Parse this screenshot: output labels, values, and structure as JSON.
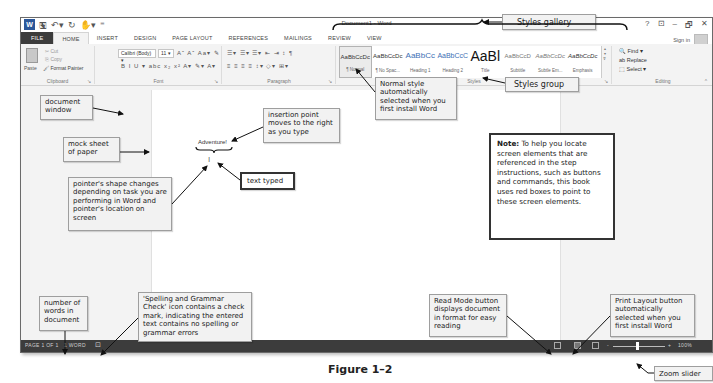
{
  "window": {
    "title": "Document1 - Word",
    "qat": [
      "word-logo",
      "save-icon",
      "undo-icon",
      "redo-icon",
      "touch-mode-icon",
      "customize-icon"
    ],
    "controls": [
      "?",
      "⊡",
      "–",
      "🗗",
      "✕"
    ],
    "sign_in": "Sign in"
  },
  "tabs": [
    {
      "label": "FILE"
    },
    {
      "label": "HOME",
      "active": true
    },
    {
      "label": "INSERT"
    },
    {
      "label": "DESIGN"
    },
    {
      "label": "PAGE LAYOUT"
    },
    {
      "label": "REFERENCES"
    },
    {
      "label": "MAILINGS"
    },
    {
      "label": "REVIEW"
    },
    {
      "label": "VIEW"
    }
  ],
  "ribbon": {
    "clipboard": {
      "label": "Clipboard",
      "paste": "Paste",
      "cut": "Cut",
      "copy": "Copy",
      "format_painter": "Format Painter"
    },
    "font": {
      "label": "Font",
      "font_name": "Calibri (Body)",
      "font_size": "11",
      "row1": "Aˆ Aˇ Aa▾ ✎",
      "row2": "B I U ▾ abc x₂ x²  A▾ ✎▾ A▾"
    },
    "paragraph": {
      "label": "Paragraph",
      "row1": "☰▾ ☰▾ ☰▾ ⇤ ⇥ ↕ ¶",
      "row2": "≡ ≡ ≡ ≡ ↕▾ ◇▾ ⊞▾"
    },
    "styles": {
      "label": "Styles",
      "gallery": [
        {
          "sample": "AaBbCcDc",
          "name": "¶ Normal",
          "selected": true
        },
        {
          "sample": "AaBbCcDc",
          "name": "¶ No Spac..."
        },
        {
          "sample": "AaBbCc",
          "name": "Heading 1",
          "kind": "heading"
        },
        {
          "sample": "AaBbCcC",
          "name": "Heading 2",
          "kind": "heading"
        },
        {
          "sample": "AaBl",
          "name": "Title",
          "kind": "title"
        },
        {
          "sample": "AaBbCcD",
          "name": "Subtitle"
        },
        {
          "sample": "AaBbCcDc",
          "name": "Subtle Em..."
        },
        {
          "sample": "AaBbCcDc",
          "name": "Emphasis"
        }
      ]
    },
    "editing": {
      "label": "Editing",
      "find": "Find ▾",
      "replace": "Replace",
      "select": "Select ▾"
    }
  },
  "document": {
    "typed_text": "Adventure!"
  },
  "statusbar": {
    "page": "PAGE 1 OF 1",
    "words": "1 WORD",
    "zoom_minus": "-",
    "zoom_plus": "+",
    "zoom_level": "100%"
  },
  "callouts": {
    "styles_gallery": "Styles gallery",
    "normal_style": "Normal style automatically selected when you first install Word",
    "styles_group": "Styles group",
    "document_window": "document window",
    "mock_sheet": "mock sheet of paper",
    "insertion_point": "insertion point moves to the right as you type",
    "text_typed": "text typed",
    "pointer_shape": "pointer's shape changes depending on task you are performing in Word and pointer's location on screen",
    "word_count": "number of words in document",
    "spelling_check": "'Spelling and Grammar Check' icon contains a check mark, indicating the entered text contains no spelling or grammar errors",
    "read_mode": "Read Mode button displays document in format for easy reading",
    "print_layout": "Print Layout button automatically selected when you first install Word",
    "zoom_slider": "Zoom slider"
  },
  "note": {
    "label": "Note:",
    "text": " To help you locate screen elements that are referenced in the step instructions, such as buttons and commands, this book uses red boxes to point to these screen elements."
  },
  "figure_caption": "Figure 1–2",
  "colors": {
    "statusbar": "#3c3c3c",
    "ribbon": "#f3f3f3",
    "file_tab": "#3c3c3c",
    "heading_style": "#3d6fb5"
  }
}
